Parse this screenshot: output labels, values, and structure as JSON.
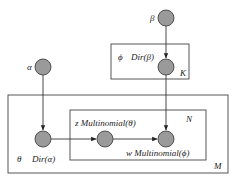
{
  "diagram": {
    "nodes": [
      {
        "id": "alpha",
        "label": "α",
        "cx": 43,
        "cy": 67
      },
      {
        "id": "beta",
        "label": "β",
        "cx": 166,
        "cy": 18
      },
      {
        "id": "phi",
        "label": "ϕ",
        "dist": "Dir(β)",
        "cx": 166,
        "cy": 67
      },
      {
        "id": "theta",
        "label": "θ",
        "dist": "Dir(α)",
        "cx": 43,
        "cy": 139
      },
      {
        "id": "z",
        "label": "z",
        "dist": "Multinomial(θ)",
        "cx": 105,
        "cy": 139
      },
      {
        "id": "w",
        "label": "w",
        "dist": "Multinomial(ϕ)",
        "cx": 166,
        "cy": 139
      }
    ],
    "plates": [
      {
        "id": "K",
        "label": "K"
      },
      {
        "id": "N",
        "label": "N"
      },
      {
        "id": "M",
        "label": "M"
      }
    ],
    "edges": [
      {
        "from": "beta",
        "to": "phi"
      },
      {
        "from": "alpha",
        "to": "theta"
      },
      {
        "from": "theta",
        "to": "z"
      },
      {
        "from": "z",
        "to": "w"
      },
      {
        "from": "phi",
        "to": "w"
      }
    ],
    "labels": {
      "alpha": "α",
      "beta": "β",
      "phi": "ϕ",
      "phi_dist": "Dir(β)",
      "theta": "θ",
      "theta_dist": "Dir(α)",
      "z_text": "z Multinomial(θ)",
      "w_text": "w Multinomial(ϕ)",
      "plate_K": "K",
      "plate_N": "N",
      "plate_M": "M"
    }
  }
}
